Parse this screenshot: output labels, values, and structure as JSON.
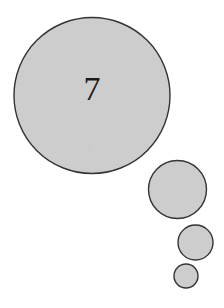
{
  "figure": {
    "background_color": "#ffffff",
    "width": 224,
    "height": 308,
    "title": "",
    "fill_color": "#cdcdcd",
    "stroke_color": "#333333",
    "label_color": "#1a1a1a",
    "stroke_width": 1.4,
    "speck_color": "#b4b4b4"
  },
  "chart_data": {
    "type": "scatter",
    "title": "",
    "xlabel": "",
    "ylabel": "",
    "grid": false,
    "legend": "none",
    "axis_visible": false,
    "xlim": [
      0,
      224
    ],
    "ylim": [
      0,
      308
    ],
    "size_encoding": "radius",
    "circles": [
      {
        "id": "circle-1",
        "label": "7",
        "cx": 92,
        "cy": 95.5,
        "r": 78,
        "fill": "#cdcdcd",
        "stroke": "#333333",
        "label_font_size": 34,
        "label_dx": 0,
        "label_dy": -3.5,
        "has_label": true
      },
      {
        "id": "circle-2",
        "label": "",
        "cx": 177.5,
        "cy": 189.5,
        "r": 29,
        "fill": "#cdcdcd",
        "stroke": "#333333",
        "label_font_size": 0,
        "label_dx": 0,
        "label_dy": 0,
        "has_label": false
      },
      {
        "id": "circle-3",
        "label": "",
        "cx": 195.5,
        "cy": 242.5,
        "r": 17.5,
        "fill": "#cdcdcd",
        "stroke": "#333333",
        "label_font_size": 0,
        "label_dx": 0,
        "label_dy": 0,
        "has_label": false
      },
      {
        "id": "circle-4",
        "label": "",
        "cx": 186,
        "cy": 276,
        "r": 12,
        "fill": "#cdcdcd",
        "stroke": "#333333",
        "label_font_size": 0,
        "label_dx": 0,
        "label_dy": 0,
        "has_label": false
      }
    ],
    "marks": [
      {
        "id": "speck-1",
        "cx": 88.5,
        "cy": 150,
        "r": 1.1,
        "fill": "#b4b4b4"
      }
    ]
  }
}
